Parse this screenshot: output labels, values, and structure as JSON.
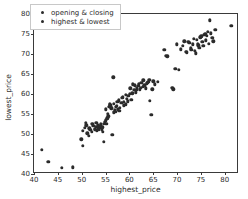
{
  "chart_data": {
    "type": "scatter",
    "title": "",
    "xlabel": "highest_price",
    "ylabel": "lowest_price",
    "xlim": [
      40,
      83
    ],
    "ylim": [
      40,
      80
    ],
    "xticks": [
      40,
      45,
      50,
      55,
      60,
      65,
      70,
      75,
      80
    ],
    "yticks": [
      40,
      45,
      50,
      55,
      60,
      65,
      70,
      75,
      80
    ],
    "grid": false,
    "legend_position": "upper left",
    "marker_color": "#2b2b2b",
    "series": [
      {
        "name": "opening & closing",
        "color": "#2b2b2b",
        "points": [
          [
            41.7,
            46.0
          ],
          [
            43.0,
            43.1
          ],
          [
            45.8,
            41.6
          ],
          [
            48.2,
            41.7
          ],
          [
            49.9,
            48.7
          ],
          [
            50.3,
            47.0
          ],
          [
            50.6,
            51.5
          ],
          [
            50.9,
            52.8
          ],
          [
            51.2,
            50.2
          ],
          [
            51.5,
            49.6
          ],
          [
            51.8,
            51.0
          ],
          [
            52.1,
            50.6
          ],
          [
            52.4,
            52.0
          ],
          [
            52.7,
            51.3
          ],
          [
            53.0,
            51.8
          ],
          [
            53.2,
            50.9
          ],
          [
            53.4,
            52.2
          ],
          [
            53.6,
            51.1
          ],
          [
            53.8,
            51.6
          ],
          [
            54.0,
            52.4
          ],
          [
            54.2,
            51.2
          ],
          [
            54.4,
            50.5
          ],
          [
            54.6,
            48.1
          ],
          [
            54.8,
            53.0
          ],
          [
            55.0,
            53.4
          ],
          [
            55.2,
            52.6
          ],
          [
            55.4,
            53.9
          ],
          [
            55.6,
            54.4
          ],
          [
            55.8,
            56.8
          ],
          [
            56.0,
            57.2
          ],
          [
            56.2,
            56.4
          ],
          [
            56.4,
            49.8
          ],
          [
            56.6,
            64.2
          ],
          [
            56.8,
            57.6
          ],
          [
            57.0,
            56.0
          ],
          [
            57.2,
            55.6
          ],
          [
            57.4,
            57.0
          ],
          [
            57.6,
            56.2
          ],
          [
            57.8,
            58.4
          ],
          [
            58.0,
            56.6
          ],
          [
            58.3,
            57.8
          ],
          [
            58.6,
            59.2
          ],
          [
            58.9,
            58.0
          ],
          [
            59.2,
            57.4
          ],
          [
            59.5,
            58.8
          ],
          [
            59.8,
            59.6
          ],
          [
            60.1,
            60.0
          ],
          [
            60.4,
            58.6
          ],
          [
            60.7,
            62.4
          ],
          [
            61.0,
            61.0
          ],
          [
            61.3,
            60.4
          ],
          [
            61.6,
            61.6
          ],
          [
            61.9,
            62.0
          ],
          [
            62.2,
            61.2
          ],
          [
            62.5,
            62.8
          ],
          [
            62.8,
            61.8
          ],
          [
            63.1,
            62.2
          ],
          [
            63.4,
            61.4
          ],
          [
            63.7,
            62.6
          ],
          [
            64.0,
            63.0
          ],
          [
            64.3,
            58.3
          ],
          [
            64.6,
            54.8
          ],
          [
            65.0,
            63.2
          ],
          [
            67.3,
            71.0
          ],
          [
            68.0,
            69.4
          ],
          [
            69.2,
            61.2
          ],
          [
            69.6,
            66.3
          ],
          [
            70.4,
            66.0
          ],
          [
            71.2,
            72.0
          ],
          [
            71.8,
            70.6
          ],
          [
            72.4,
            73.0
          ],
          [
            72.9,
            71.4
          ],
          [
            73.3,
            72.4
          ],
          [
            73.7,
            70.8
          ],
          [
            74.1,
            73.6
          ],
          [
            74.5,
            72.2
          ],
          [
            74.9,
            74.2
          ],
          [
            75.3,
            73.0
          ],
          [
            75.7,
            74.8
          ],
          [
            76.1,
            73.4
          ],
          [
            76.5,
            75.6
          ],
          [
            76.9,
            78.4
          ],
          [
            77.4,
            74.0
          ],
          [
            78.0,
            76.0
          ],
          [
            81.4,
            77.1
          ]
        ]
      },
      {
        "name": "highest & lowest",
        "color": "#2b2b2b",
        "points": [
          [
            50.2,
            50.8
          ],
          [
            51.0,
            52.2
          ],
          [
            51.6,
            51.4
          ],
          [
            52.2,
            52.6
          ],
          [
            52.8,
            51.0
          ],
          [
            53.1,
            52.8
          ],
          [
            53.5,
            51.5
          ],
          [
            53.9,
            52.0
          ],
          [
            54.3,
            51.7
          ],
          [
            54.7,
            52.5
          ],
          [
            55.1,
            56.2
          ],
          [
            55.5,
            55.0
          ],
          [
            55.9,
            57.4
          ],
          [
            56.3,
            56.6
          ],
          [
            56.7,
            55.4
          ],
          [
            57.1,
            56.8
          ],
          [
            57.5,
            58.0
          ],
          [
            57.9,
            55.8
          ],
          [
            58.4,
            59.0
          ],
          [
            58.8,
            57.2
          ],
          [
            59.3,
            59.8
          ],
          [
            59.7,
            58.2
          ],
          [
            60.2,
            61.4
          ],
          [
            60.6,
            60.2
          ],
          [
            61.1,
            62.2
          ],
          [
            61.5,
            61.0
          ],
          [
            62.0,
            62.6
          ],
          [
            62.4,
            61.6
          ],
          [
            62.9,
            63.4
          ],
          [
            63.3,
            62.0
          ],
          [
            63.8,
            62.8
          ],
          [
            64.2,
            63.6
          ],
          [
            64.8,
            61.2
          ],
          [
            65.4,
            62.4
          ],
          [
            66.0,
            63.0
          ],
          [
            67.6,
            69.6
          ],
          [
            69.0,
            61.6
          ],
          [
            70.0,
            72.4
          ],
          [
            70.8,
            71.2
          ],
          [
            71.5,
            73.2
          ],
          [
            72.1,
            70.4
          ],
          [
            72.6,
            72.8
          ],
          [
            73.0,
            71.0
          ],
          [
            73.5,
            73.8
          ],
          [
            73.9,
            70.2
          ],
          [
            74.3,
            72.6
          ],
          [
            74.7,
            71.6
          ],
          [
            75.1,
            74.4
          ],
          [
            75.5,
            72.0
          ],
          [
            75.9,
            75.0
          ],
          [
            76.3,
            74.6
          ],
          [
            76.7,
            72.6
          ],
          [
            77.1,
            75.2
          ],
          [
            77.6,
            73.2
          ]
        ]
      }
    ]
  }
}
